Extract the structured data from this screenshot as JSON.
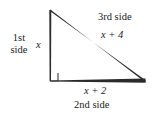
{
  "figure": {
    "type": "right-triangle-geometry-diagram",
    "background_color": "#ffffff",
    "stroke_color": "#232323",
    "labels": {
      "first_side_line1": "1st",
      "first_side_line2": "side",
      "vertical_leg_length": "x",
      "third_side_name": "3rd side",
      "third_side_length": "x + 4",
      "second_side_length": "x + 2",
      "second_side_name": "2nd side"
    },
    "geometry": {
      "apex": [
        50,
        10
      ],
      "right_angle_vertex": [
        50,
        81
      ],
      "right_vertex": [
        145,
        81
      ],
      "right_angle_marker_size": 8
    }
  }
}
